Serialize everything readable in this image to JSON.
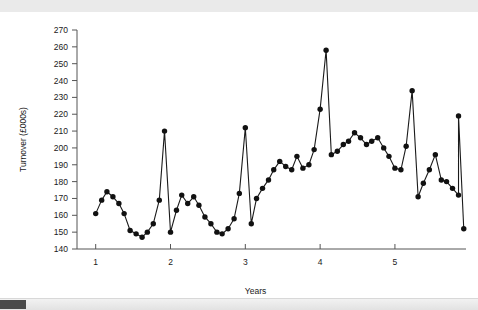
{
  "chart_data": {
    "type": "line",
    "title": "",
    "xlabel": "Years",
    "ylabel": "Turnover (£000s)",
    "xlim": [
      0.75,
      5.95
    ],
    "ylim": [
      140,
      270
    ],
    "ytick_step": 10,
    "yticks": [
      140,
      150,
      160,
      170,
      180,
      190,
      200,
      210,
      220,
      230,
      240,
      250,
      260,
      270
    ],
    "xticks": [
      1,
      2,
      3,
      4,
      5
    ],
    "grid": false,
    "legend": false,
    "marker": "filled-circle",
    "series": [
      {
        "name": "Turnover",
        "x": [
          1.0,
          1.08,
          1.15,
          1.23,
          1.31,
          1.38,
          1.46,
          1.54,
          1.62,
          1.69,
          1.77,
          1.85,
          1.92,
          2.0,
          2.08,
          2.15,
          2.23,
          2.31,
          2.38,
          2.46,
          2.54,
          2.62,
          2.69,
          2.77,
          2.85,
          2.92,
          3.0,
          3.08,
          3.15,
          3.23,
          3.31,
          3.38,
          3.46,
          3.54,
          3.62,
          3.69,
          3.77,
          3.85,
          3.92,
          4.0,
          4.08,
          4.15,
          4.23,
          4.31,
          4.38,
          4.46,
          4.54,
          4.62,
          4.69,
          4.77,
          4.85,
          4.92,
          5.0,
          5.08,
          5.15,
          5.23,
          5.31,
          5.38,
          5.46,
          5.54,
          5.62,
          5.69,
          5.77,
          5.85
        ],
        "values": [
          161,
          169,
          174,
          171,
          167,
          161,
          151,
          149,
          147,
          150,
          155,
          169,
          210,
          150,
          163,
          172,
          167,
          171,
          166,
          159,
          155,
          150,
          149,
          152,
          158,
          173,
          212,
          155,
          170,
          176,
          181,
          187,
          192,
          189,
          187,
          195,
          188,
          190,
          199,
          223,
          258,
          196,
          198,
          202,
          204,
          209,
          206,
          202,
          204,
          206,
          200,
          195,
          188,
          187,
          201,
          234,
          171,
          179,
          187,
          196,
          181,
          180,
          176,
          172
        ],
        "color": "#111111"
      }
    ],
    "annotations": [
      {
        "label": "peak",
        "x": 4.08,
        "y": 258
      },
      {
        "label": "peak",
        "x": 5.23,
        "y": 234
      },
      {
        "label": "peak",
        "x": 3.0,
        "y": 212
      },
      {
        "label": "peak",
        "x": 1.92,
        "y": 210
      }
    ]
  },
  "tail_points": {
    "x": [
      5.85,
      5.92
    ],
    "values": [
      219,
      152
    ]
  },
  "scrollbar": {
    "orientation": "horizontal",
    "thumb_position": "left"
  }
}
